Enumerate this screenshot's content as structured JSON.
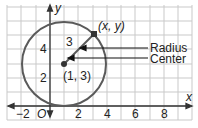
{
  "diagram": {
    "axes": {
      "x_label": "x",
      "y_label": "y",
      "origin_label": "O",
      "x_ticks": [
        "−2",
        "2",
        "4",
        "6",
        "8"
      ],
      "y_ticks": [
        "2",
        "4"
      ]
    },
    "circle": {
      "center": [
        1,
        3
      ],
      "radius": 3,
      "point_on_circle_label": "(x, y)",
      "center_label": "(1, 3)",
      "radius_value_label": "3",
      "color": "#5a5a5a"
    },
    "callouts": {
      "radius": "Radius",
      "center": "Center"
    },
    "colors": {
      "grid": "#c9c9c9",
      "axis": "#333333",
      "circle": "#5a5a5a",
      "text": "#222222"
    }
  }
}
